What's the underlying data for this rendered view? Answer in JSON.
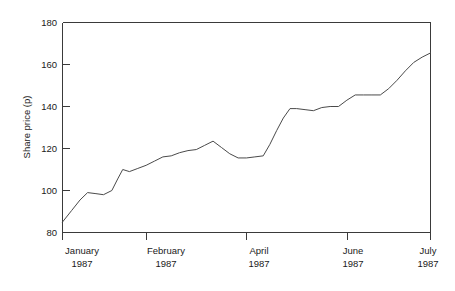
{
  "chart_data": {
    "type": "line",
    "title": "",
    "xlabel": "",
    "ylabel": "Share price (p)",
    "ylim": [
      80,
      180
    ],
    "yticks": [
      80,
      100,
      120,
      140,
      160,
      180
    ],
    "ytick_labels": [
      "80",
      "100",
      "120",
      "140",
      "160",
      "180"
    ],
    "grid": false,
    "legend": "none",
    "xtick_labels": [
      {
        "month": "January",
        "year": "1987"
      },
      {
        "month": "February",
        "year": "1987"
      },
      {
        "month": "April",
        "year": "1987"
      },
      {
        "month": "June",
        "year": "1987"
      },
      {
        "month": "July",
        "year": "1987"
      }
    ],
    "xtick_month_0": "January",
    "xtick_year_0": "1987",
    "xtick_month_1": "February",
    "xtick_year_1": "1987",
    "xtick_month_2": "April",
    "xtick_year_2": "1987",
    "xtick_month_3": "June",
    "xtick_year_3": "1987",
    "xtick_month_4": "July",
    "xtick_year_4": "1987",
    "xtick_positions_value": [
      0,
      5,
      11,
      17,
      22
    ],
    "xlim": [
      0,
      22
    ],
    "series": [
      {
        "name": "Share price",
        "x": [
          0,
          0.55,
          1.05,
          1.5,
          2.0,
          2.45,
          2.95,
          3.3,
          3.6,
          4.0,
          4.5,
          5.0,
          5.5,
          6.0,
          6.5,
          7.0,
          7.5,
          8.0,
          8.5,
          9.0,
          9.5,
          10.0,
          10.5,
          11.0,
          11.5,
          12.0,
          12.4,
          12.8,
          13.2,
          13.6,
          14.0,
          14.5,
          15.0,
          15.5,
          16.0,
          16.5,
          17.0,
          17.5,
          18.0,
          18.5,
          19.0,
          19.5,
          20.0,
          20.5,
          21.0,
          21.5,
          22.0
        ],
        "values": [
          85.0,
          90.5,
          95.5,
          99.0,
          98.5,
          98.0,
          100.0,
          105.5,
          110.0,
          109.0,
          110.5,
          112.0,
          114.0,
          116.0,
          116.5,
          118.0,
          119.0,
          119.5,
          121.5,
          123.5,
          120.5,
          117.5,
          115.5,
          115.5,
          116.0,
          116.5,
          122.0,
          128.5,
          134.5,
          139.0,
          139.0,
          138.5,
          138.0,
          139.5,
          140.0,
          140.0,
          143.0,
          145.5,
          145.5,
          145.5,
          145.5,
          148.5,
          152.5,
          157.0,
          161.0,
          163.5,
          165.5
        ]
      }
    ],
    "y_min_value": 85.0,
    "y_max_value": 165.5
  }
}
